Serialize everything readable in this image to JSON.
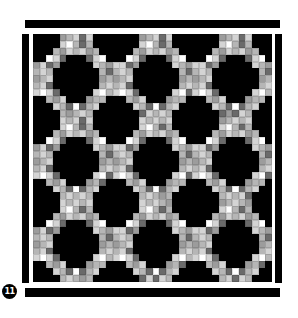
{
  "figure": {
    "badge_number": "11"
  },
  "frame": {
    "top_bar": {
      "x": 25,
      "y": 20,
      "w": 255,
      "h": 8
    },
    "bottom_bar": {
      "x": 25,
      "y": 288,
      "w": 255,
      "h": 9
    },
    "left_bar": {
      "x": 22,
      "y": 34,
      "w": 7,
      "h": 249
    },
    "right_bar": {
      "x": 275,
      "y": 34,
      "w": 7,
      "h": 249
    }
  },
  "quilt": {
    "x": 33,
    "y": 34,
    "width": 239,
    "height": 248,
    "cols": 36,
    "rows": 36,
    "period": 12,
    "octagon_half_widths": [
      1,
      2,
      3,
      3,
      3,
      2,
      1
    ],
    "octagon_centers_in_tile": [
      [
        0,
        0
      ],
      [
        6,
        6
      ]
    ],
    "palette": {
      "black": "#000000",
      "white": "#ffffff",
      "light": "#d4d4d4",
      "mid": "#b6b6b6",
      "gray": "#9c9c9c",
      "dark": "#6a6a6a"
    },
    "lattice_tile": [
      "............",
      "....LWMDML..",
      "...MGLMLGM..",
      "..WLDMGLDLW.",
      ".LDGMWMGDLMG",
      "MLMLGDGLMLMD",
      "GMLMDGDMLMGM",
      "MLDGMWMGDLML",
      ".WLDLGMLDLW.",
      "..MGLMLMGM..",
      "...LMDWDML..",
      "............"
    ],
    "tile_codes": {
      "W": "white",
      "L": "light",
      "M": "mid",
      "G": "gray",
      "D": "dark"
    }
  },
  "badge": {
    "x": 2,
    "y": 284,
    "label": "11"
  }
}
